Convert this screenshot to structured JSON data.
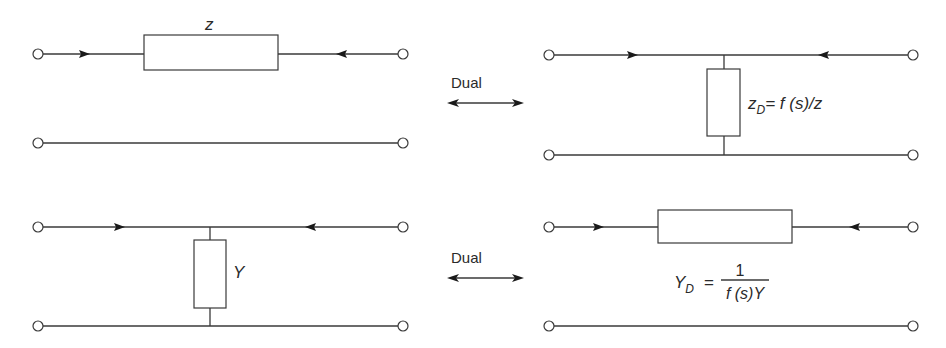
{
  "diagram": {
    "type": "two-port network duality illustration",
    "top_left": {
      "element": "series impedance",
      "label": "z"
    },
    "top_dual": {
      "label": "Dual"
    },
    "top_right": {
      "element": "shunt impedance",
      "label_main": "z",
      "label_sub": "D",
      "label_rhs": "= f (s)/z"
    },
    "bottom_left": {
      "element": "shunt admittance",
      "label": "Y"
    },
    "bottom_dual": {
      "label": "Dual"
    },
    "bottom_right": {
      "element": "series admittance",
      "label_main": "Y",
      "label_sub": "D",
      "label_eq": "=",
      "numerator": "1",
      "denominator": "f (s)Y"
    }
  },
  "colors": {
    "line": "#3a3a3a",
    "text": "#2a2a2a",
    "background": "#ffffff"
  }
}
